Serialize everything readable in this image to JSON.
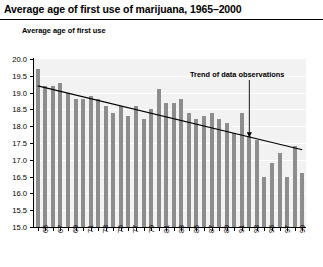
{
  "title": "Average age of first use of marijuana, 1965–2000",
  "y_axis_caption": "Average age of first use",
  "annotation": {
    "text": "Trend of data observations"
  },
  "chart_data": {
    "type": "bar",
    "title": "Average age of first use of marijuana, 1965–2000",
    "xlabel": "",
    "ylabel": "Average age of first use",
    "ylim": [
      15.0,
      20.0
    ],
    "ytick_labels": [
      "20.0",
      "19.5",
      "19.0",
      "18.5",
      "18.0",
      "17.5",
      "17.0",
      "16.5",
      "16.0",
      "15.5",
      "15.0"
    ],
    "ytick_values": [
      20.0,
      19.5,
      19.0,
      18.5,
      18.0,
      17.5,
      17.0,
      16.5,
      16.0,
      15.5,
      15.0
    ],
    "grid": true,
    "legend": "none",
    "categories": [
      "65",
      "66",
      "67",
      "68",
      "69",
      "70",
      "71",
      "72",
      "73",
      "74",
      "75",
      "76",
      "77",
      "78",
      "79",
      "80",
      "81",
      "82",
      "83",
      "84",
      "85",
      "86",
      "87",
      "88",
      "89",
      "90",
      "91",
      "92",
      "93",
      "94",
      "95",
      "96",
      "97",
      "98",
      "99",
      "00"
    ],
    "xtick_labels": [
      "65",
      "67",
      "69",
      "71",
      "73",
      "75",
      "77",
      "79",
      "81",
      "83",
      "85",
      "87",
      "89",
      "91",
      "93",
      "95",
      "97",
      "99"
    ],
    "values": [
      19.7,
      19.2,
      19.2,
      19.3,
      19.0,
      18.8,
      18.8,
      18.9,
      18.8,
      18.6,
      18.4,
      18.6,
      18.3,
      18.6,
      18.2,
      18.5,
      19.1,
      18.7,
      18.7,
      18.8,
      18.4,
      18.2,
      18.3,
      18.4,
      18.2,
      18.1,
      17.8,
      18.4,
      17.7,
      17.6,
      16.5,
      16.9,
      17.2,
      16.5,
      17.4,
      16.6
    ],
    "series": [
      {
        "name": "Average age of first use",
        "values": [
          19.7,
          19.2,
          19.2,
          19.3,
          19.0,
          18.8,
          18.8,
          18.9,
          18.8,
          18.6,
          18.4,
          18.6,
          18.3,
          18.6,
          18.2,
          18.5,
          19.1,
          18.7,
          18.7,
          18.8,
          18.4,
          18.2,
          18.3,
          18.4,
          18.2,
          18.1,
          17.8,
          18.4,
          17.7,
          17.6,
          16.5,
          16.9,
          17.2,
          16.5,
          17.4,
          16.6
        ],
        "color": "#8d8d8d"
      }
    ],
    "trend_line": {
      "name": "Trend of data observations",
      "start_value": 19.2,
      "end_value": 17.3,
      "color": "#000000"
    },
    "annotations": [
      {
        "text": "Trend of data observations",
        "points_to_year": "93"
      }
    ],
    "colors": {
      "bar": "#8d8d8d",
      "plot_background": "#f2f2f2",
      "gridline": "#ffffff",
      "axis": "#000000",
      "trend": "#000000"
    }
  }
}
